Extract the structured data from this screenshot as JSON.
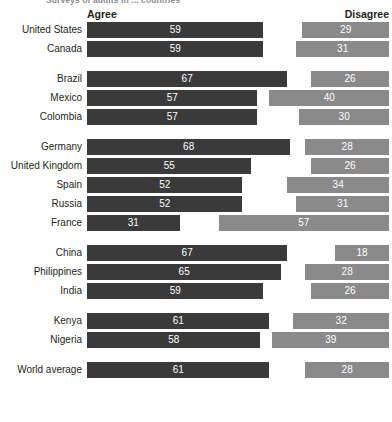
{
  "top_note": "Surveys of adults in ... countries",
  "header": {
    "agree_label": "Agree",
    "disagree_label": "Disagree"
  },
  "chart_data": {
    "type": "bar",
    "title": "",
    "subtitle": "",
    "xlabel": "",
    "ylabel": "",
    "xlim": [
      0,
      100
    ],
    "grid": false,
    "legend_position": "top",
    "orientation": "horizontal",
    "layout": "diverging-paired",
    "series": [
      {
        "name": "Agree",
        "color": "#3a3a3a",
        "align": "left"
      },
      {
        "name": "Disagree",
        "color": "#8a8a8a",
        "align": "right"
      }
    ],
    "categories": [
      "United States",
      "Canada",
      "Brazil",
      "Mexico",
      "Colombia",
      "Germany",
      "United Kingdom",
      "Spain",
      "Russia",
      "France",
      "China",
      "Philippines",
      "India",
      "Kenya",
      "Nigeria",
      "World average"
    ],
    "agree": [
      59,
      59,
      67,
      57,
      57,
      68,
      55,
      52,
      52,
      31,
      67,
      65,
      59,
      61,
      58,
      61
    ],
    "disagree": [
      29,
      31,
      26,
      40,
      30,
      28,
      26,
      34,
      31,
      57,
      18,
      28,
      26,
      32,
      39,
      28
    ],
    "groups": [
      {
        "id": "north-america",
        "rows": [
          {
            "label": "United States",
            "agree": 59,
            "disagree": 29
          },
          {
            "label": "Canada",
            "agree": 59,
            "disagree": 31
          }
        ]
      },
      {
        "id": "latin-america",
        "rows": [
          {
            "label": "Brazil",
            "agree": 67,
            "disagree": 26
          },
          {
            "label": "Mexico",
            "agree": 57,
            "disagree": 40
          },
          {
            "label": "Colombia",
            "agree": 57,
            "disagree": 30
          }
        ]
      },
      {
        "id": "europe",
        "rows": [
          {
            "label": "Germany",
            "agree": 68,
            "disagree": 28
          },
          {
            "label": "United Kingdom",
            "agree": 55,
            "disagree": 26
          },
          {
            "label": "Spain",
            "agree": 52,
            "disagree": 34
          },
          {
            "label": "Russia",
            "agree": 52,
            "disagree": 31
          },
          {
            "label": "France",
            "agree": 31,
            "disagree": 57
          }
        ]
      },
      {
        "id": "asia",
        "rows": [
          {
            "label": "China",
            "agree": 67,
            "disagree": 18
          },
          {
            "label": "Philippines",
            "agree": 65,
            "disagree": 28
          },
          {
            "label": "India",
            "agree": 59,
            "disagree": 26
          }
        ]
      },
      {
        "id": "africa",
        "rows": [
          {
            "label": "Kenya",
            "agree": 61,
            "disagree": 32
          },
          {
            "label": "Nigeria",
            "agree": 58,
            "disagree": 39
          }
        ]
      },
      {
        "id": "world",
        "rows": [
          {
            "label": "World average",
            "agree": 61,
            "disagree": 28
          }
        ]
      }
    ]
  }
}
